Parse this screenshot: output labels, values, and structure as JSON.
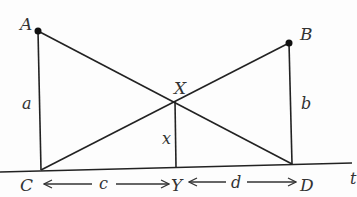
{
  "diagram": {
    "points": {
      "A": {
        "label": "A"
      },
      "B": {
        "label": "B"
      },
      "C": {
        "label": "C"
      },
      "D": {
        "label": "D"
      },
      "X": {
        "label": "X"
      },
      "Y": {
        "label": "Y"
      }
    },
    "segments": {
      "a": {
        "label": "a"
      },
      "b": {
        "label": "b"
      },
      "x": {
        "label": "x"
      },
      "c": {
        "label": "c"
      },
      "d": {
        "label": "d"
      }
    },
    "line_label": "t",
    "stroke_color": "#222222"
  }
}
